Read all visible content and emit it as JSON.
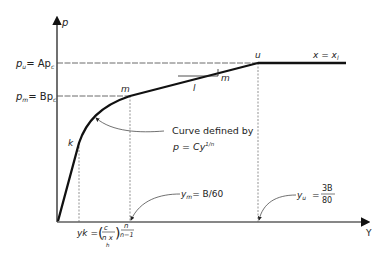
{
  "diagram": {
    "axes": {
      "y_axis_label": "p",
      "x_axis_label": "Y"
    },
    "levels": {
      "pu_label": "p",
      "pu_sub": "u",
      "pu_rhs": "= Ap",
      "pu_rhs_sub": "c",
      "pm_label": "p",
      "pm_sub": "m",
      "pm_rhs": "= Bp",
      "pm_rhs_sub": "c"
    },
    "points": {
      "k": "k",
      "m": "m",
      "u": "u"
    },
    "slope": {
      "rise": "m",
      "run": "l"
    },
    "condition": "x = x",
    "condition_sub": "l",
    "annotation": {
      "line1": "Curve defined by",
      "line2_p": "p = Cy",
      "line2_exp": "1/n"
    },
    "x_markers": {
      "yk_label": "yk =",
      "yk_frac_num": "c",
      "yk_frac_den": "n x",
      "yk_frac_den_sub": "h",
      "yk_exp_num": "n",
      "yk_exp_den": "n−1",
      "ym_label": "y",
      "ym_sub": "m",
      "ym_rhs": "= B/60",
      "yu_label": "y",
      "yu_sub": "u",
      "yu_eq": "=",
      "yu_num": "3B",
      "yu_den": "80"
    }
  }
}
